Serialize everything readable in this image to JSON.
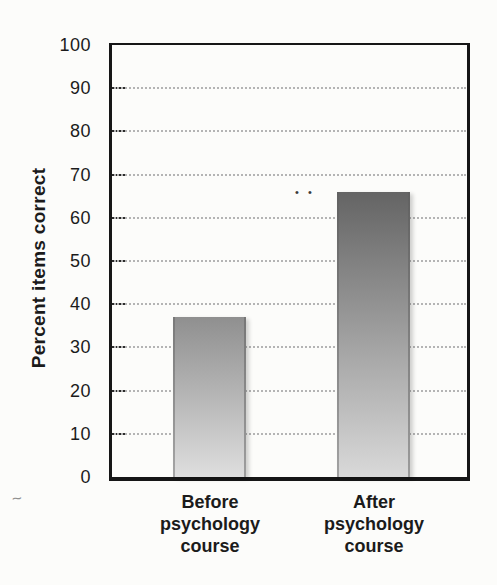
{
  "chart_data": {
    "type": "bar",
    "categories": [
      "Before psychology course",
      "After psychology course"
    ],
    "values": [
      37,
      66
    ],
    "title": "",
    "xlabel": "",
    "ylabel": "Percent items correct",
    "ylim": [
      0,
      100
    ],
    "yticks": [
      0,
      10,
      20,
      30,
      40,
      50,
      60,
      70,
      80,
      90,
      100
    ],
    "grid": "horizontal-dotted",
    "legend": "none"
  },
  "chart": {
    "ylabel": "Percent items correct",
    "yticks": [
      100,
      90,
      80,
      70,
      60,
      50,
      40,
      30,
      20,
      10,
      0
    ],
    "categories": [
      {
        "id": "before-psychology-course",
        "lines": [
          "Before",
          "psychology",
          "course"
        ],
        "value": 37,
        "gradient_top": "#8f8f8f",
        "gradient_bottom": "#dedede"
      },
      {
        "id": "after-psychology-course",
        "lines": [
          "After",
          "psychology",
          "course"
        ],
        "value": 66,
        "gradient_top": "#646464",
        "gradient_bottom": "#d9d9d9"
      }
    ],
    "colors": {
      "axis": "#161616",
      "grid_dots": "#b4b4b4",
      "tick_mark": "#2b2b2b",
      "text": "#1b1b1b",
      "background": "#fcfcfa"
    }
  },
  "artifacts": {
    "pencil_squiggle": "~",
    "ink_specks": "• •"
  }
}
